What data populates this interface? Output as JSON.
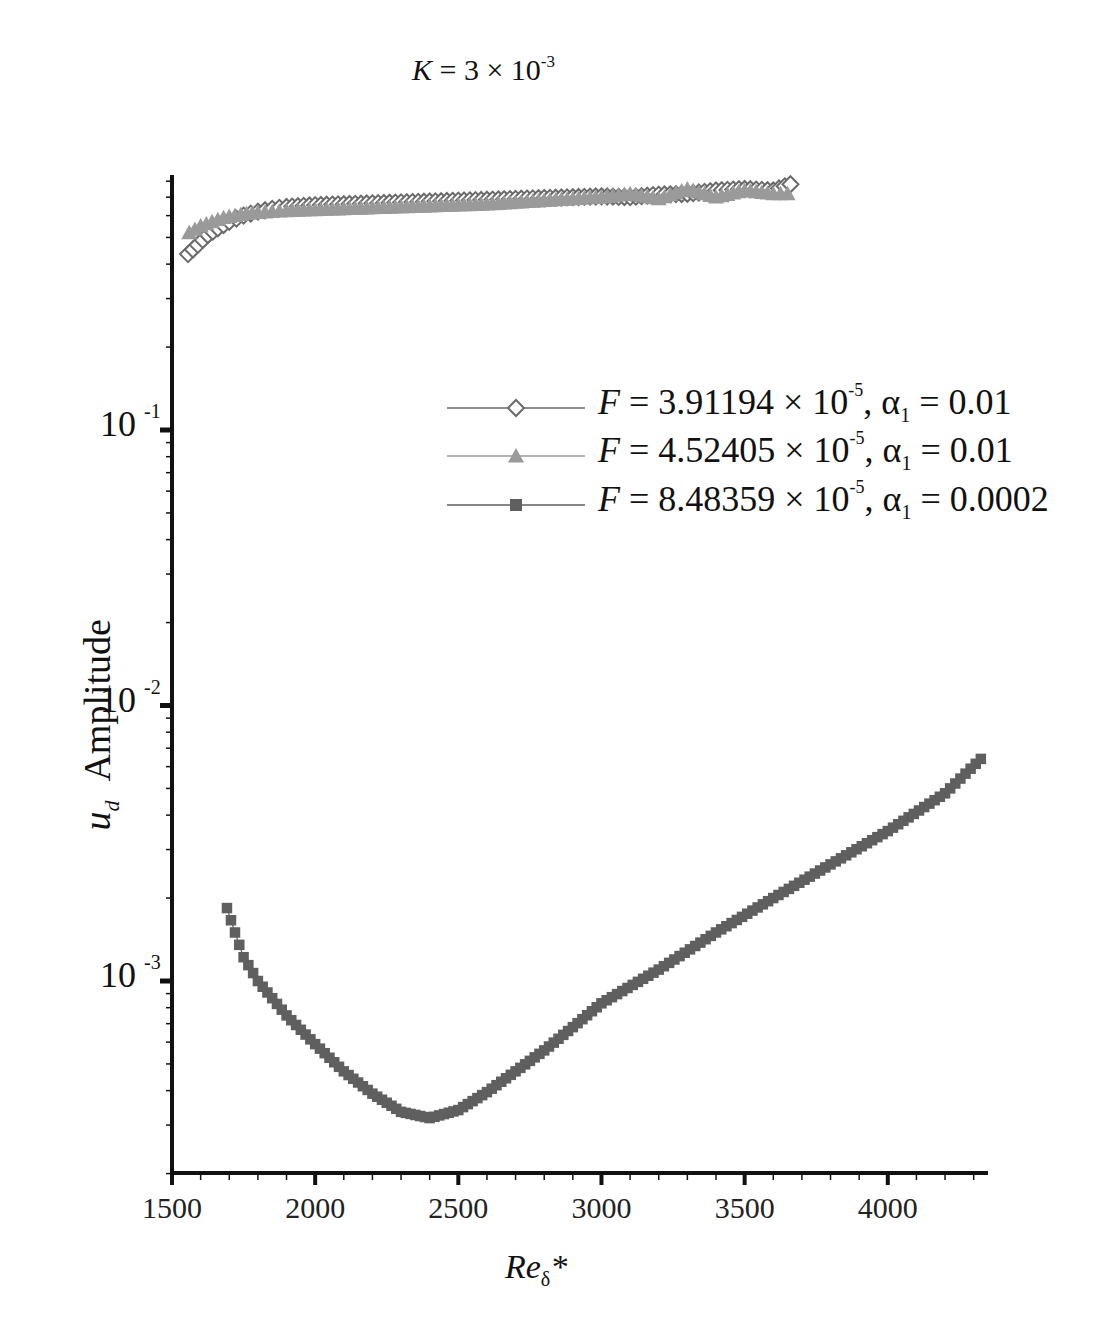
{
  "chart_data": {
    "type": "scatter",
    "title_parts": {
      "var": "K",
      "eq": " = 3 × 10",
      "exp": "-3"
    },
    "xlabel": "Re_δ*",
    "xlabel_parts": {
      "base": "Re",
      "sub": "δ",
      "suffix": "*"
    },
    "ylabel": "u_d Amplitude",
    "ylabel_parts": {
      "var": "u",
      "sub": "d",
      "rest": "Amplitude"
    },
    "xlim": [
      1500,
      4350
    ],
    "ylim": [
      0.0002,
      0.84
    ],
    "yscale": "log",
    "x_ticks": [
      1500,
      2000,
      2500,
      3000,
      3500,
      4000
    ],
    "x_tick_labels": [
      "1500",
      "2000",
      "2500",
      "3000",
      "3500",
      "4000"
    ],
    "y_ticks": [
      0.1,
      0.01,
      0.001
    ],
    "y_tick_labels": [
      {
        "base": "10",
        "exp": "-1"
      },
      {
        "base": "10",
        "exp": "-2"
      },
      {
        "base": "10",
        "exp": "-3"
      }
    ],
    "grid": false,
    "legend_position": "upper right (inside)",
    "series": [
      {
        "name": "F = 3.91194 × 10^-5, α1 = 0.01",
        "label_parts": {
          "F": "3.91194",
          "exp": "-5",
          "alpha": "0.01"
        },
        "marker": "diamond-open",
        "color": "#6a6a6a",
        "x": [
          1556,
          1590,
          1625,
          1660,
          1700,
          1750,
          1800,
          1850,
          1900,
          2000,
          2100,
          2200,
          2300,
          2400,
          2500,
          2600,
          2700,
          2800,
          2900,
          3000,
          3100,
          3200,
          3300,
          3400,
          3500,
          3600,
          3660
        ],
        "y": [
          0.435,
          0.47,
          0.51,
          0.54,
          0.57,
          0.6,
          0.62,
          0.635,
          0.645,
          0.655,
          0.66,
          0.665,
          0.67,
          0.675,
          0.68,
          0.685,
          0.69,
          0.695,
          0.7,
          0.705,
          0.7,
          0.715,
          0.72,
          0.74,
          0.75,
          0.74,
          0.78
        ]
      },
      {
        "name": "F = 4.52405 × 10^-5, α1 = 0.01",
        "label_parts": {
          "F": "4.52405",
          "exp": "-5",
          "alpha": "0.01"
        },
        "marker": "triangle-filled",
        "color": "#9a9a9a",
        "x": [
          1560,
          1600,
          1640,
          1680,
          1720,
          1760,
          1800,
          1850,
          1900,
          2000,
          2100,
          2200,
          2300,
          2400,
          2500,
          2600,
          2700,
          2800,
          2900,
          3000,
          3100,
          3200,
          3300,
          3400,
          3500,
          3600,
          3650
        ],
        "y": [
          0.52,
          0.55,
          0.57,
          0.59,
          0.6,
          0.61,
          0.615,
          0.62,
          0.625,
          0.63,
          0.635,
          0.64,
          0.645,
          0.65,
          0.655,
          0.66,
          0.67,
          0.68,
          0.69,
          0.7,
          0.72,
          0.69,
          0.75,
          0.7,
          0.74,
          0.72,
          0.72
        ]
      },
      {
        "name": "F = 8.48359 × 10^-5, α1 = 0.0002",
        "label_parts": {
          "F": "8.48359",
          "exp": "-5",
          "alpha": "0.0002"
        },
        "marker": "square-filled",
        "color": "#5f5f5f",
        "x": [
          1692,
          1720,
          1750,
          1800,
          1900,
          2000,
          2100,
          2200,
          2300,
          2400,
          2500,
          2600,
          2700,
          2800,
          2900,
          3000,
          3200,
          3400,
          3600,
          3800,
          4000,
          4200,
          4325
        ],
        "y": [
          0.00184,
          0.0015,
          0.00122,
          0.001,
          0.00075,
          0.00059,
          0.00047,
          0.00039,
          0.000335,
          0.000318,
          0.00034,
          0.000395,
          0.00047,
          0.00056,
          0.00068,
          0.00083,
          0.0011,
          0.0015,
          0.002,
          0.00265,
          0.0035,
          0.0048,
          0.0064
        ]
      }
    ]
  },
  "layout": {
    "plot": {
      "left": 172,
      "right": 988,
      "top": 175,
      "bottom": 1173
    },
    "decade_px": 275.5,
    "y_ref": {
      "value": 0.001,
      "px": 981
    }
  }
}
